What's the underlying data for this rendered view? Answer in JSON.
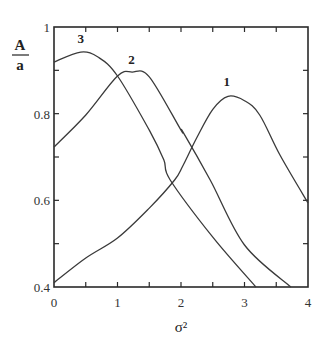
{
  "chart_data": {
    "type": "line",
    "title": "",
    "xlabel": "σ²",
    "ylabel": "A/a",
    "ylabel_numerator": "A",
    "ylabel_denominator": "a",
    "xlim": [
      0,
      4
    ],
    "ylim": [
      0.4,
      1.0
    ],
    "x_ticks": [
      0,
      1,
      2,
      3,
      4
    ],
    "x_tick_labels": [
      "0",
      "1",
      "2",
      "3",
      "4"
    ],
    "x_minor_ticks": [
      0.5,
      1.5,
      2.5,
      3.5
    ],
    "y_ticks": [
      0.4,
      0.6,
      0.8,
      1.0
    ],
    "y_tick_labels": [
      "0.4",
      "0.6",
      "0.8",
      "1"
    ],
    "y_minor_ticks": [
      0.5,
      0.7,
      0.9
    ],
    "grid": false,
    "legend": "inline curve labels",
    "series": [
      {
        "name": "1",
        "label_pos": [
          2.72,
          0.865
        ],
        "x": [
          0,
          0.5,
          1.0,
          1.5,
          1.9,
          2.03,
          2.25,
          2.5,
          2.74,
          3.0,
          3.24,
          3.56,
          4.0
        ],
        "y": [
          0.41,
          0.467,
          0.513,
          0.582,
          0.647,
          0.68,
          0.745,
          0.81,
          0.84,
          0.83,
          0.797,
          0.704,
          0.594
        ]
      },
      {
        "name": "2",
        "label_pos": [
          1.22,
          0.915
        ],
        "x": [
          0,
          0.5,
          1.0,
          1.23,
          1.5,
          2.0,
          2.03,
          2.46,
          3.0,
          3.73
        ],
        "y": [
          0.723,
          0.797,
          0.887,
          0.896,
          0.885,
          0.762,
          0.758,
          0.647,
          0.497,
          0.4
        ]
      },
      {
        "name": "3",
        "label_pos": [
          0.42,
          0.962
        ],
        "x": [
          0,
          0.42,
          0.7,
          1.0,
          1.5,
          1.73,
          1.83,
          2.5,
          3.18
        ],
        "y": [
          0.919,
          0.942,
          0.93,
          0.887,
          0.762,
          0.693,
          0.647,
          0.515,
          0.4
        ]
      }
    ]
  }
}
